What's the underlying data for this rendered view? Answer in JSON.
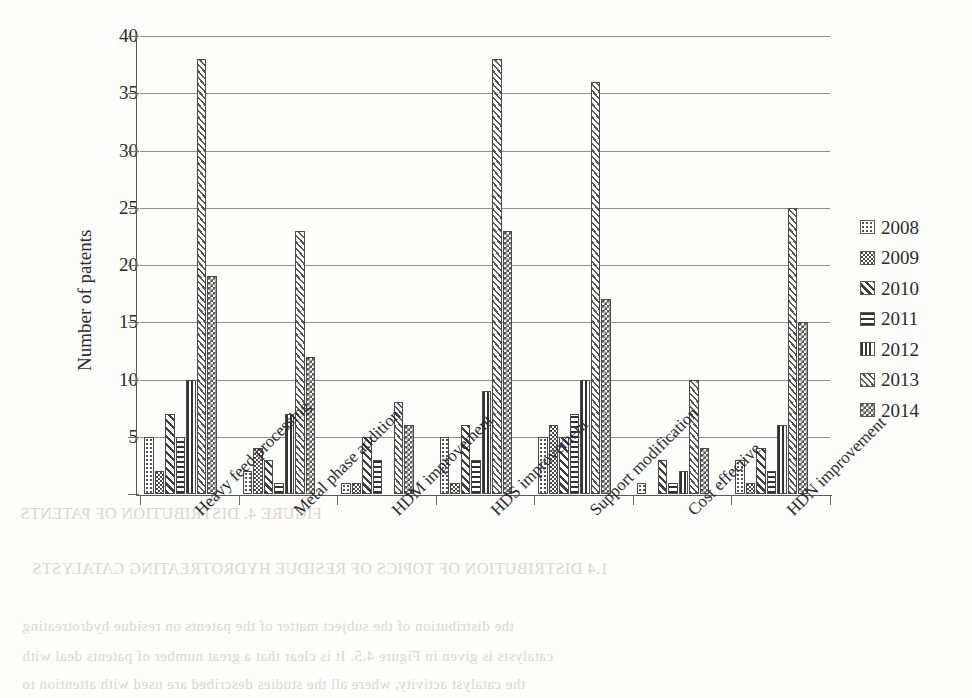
{
  "chart_data": {
    "type": "bar",
    "title": "",
    "subtitle": "",
    "xlabel": "",
    "ylabel": "Number of patents",
    "ylim": [
      0,
      40
    ],
    "ytick_values": [
      0,
      5,
      10,
      15,
      20,
      25,
      30,
      35,
      40
    ],
    "ytick_labels": [
      "",
      "5",
      "10",
      "15",
      "20",
      "25",
      "30",
      "35",
      "40"
    ],
    "grid": true,
    "legend_position": "right",
    "orientation": "vertical",
    "grouping": "grouped",
    "categories": [
      "Heavy feed processing",
      "Metal phase addition",
      "HDM improvement",
      "HDS improvement",
      "Support modification",
      "Cost effective",
      "HDN improvement"
    ],
    "series": [
      {
        "name": "2008",
        "pattern": "dotted",
        "values": [
          5,
          2,
          1,
          5,
          5,
          1,
          3
        ]
      },
      {
        "name": "2009",
        "pattern": "checker-coarse",
        "values": [
          2,
          4,
          1,
          1,
          6,
          0,
          1
        ]
      },
      {
        "name": "2010",
        "pattern": "diagonal-hatch",
        "values": [
          7,
          3,
          5,
          6,
          5,
          3,
          4
        ]
      },
      {
        "name": "2011",
        "pattern": "horizontal-lines",
        "values": [
          5,
          1,
          3,
          3,
          7,
          1,
          2
        ]
      },
      {
        "name": "2012",
        "pattern": "vertical-lines",
        "values": [
          10,
          7,
          0,
          9,
          10,
          2,
          6
        ]
      },
      {
        "name": "2013",
        "pattern": "fine-diagonal",
        "values": [
          38,
          23,
          8,
          38,
          36,
          10,
          25
        ]
      },
      {
        "name": "2014",
        "pattern": "checker-dense",
        "values": [
          19,
          12,
          6,
          23,
          17,
          4,
          15
        ]
      }
    ]
  },
  "legend": {
    "entries": [
      "2008",
      "2009",
      "2010",
      "2011",
      "2012",
      "2013",
      "2014"
    ]
  },
  "colors": {
    "axis": "#5a5a5a",
    "gridline": "#8e8e8e",
    "bar_outline": "#4a4a4a",
    "text": "#2b2b2b",
    "background": "#fdfdfb",
    "bleed_text": "#d9d6cf"
  },
  "background_bleed": {
    "lines": [
      "FIGURE 4.  DISTRIBUTION OF PATENTS",
      "1.4  DISTRIBUTION OF TOPICS OF RESIDUE HYDROTREATING CATALYSTS",
      "the distribution of the subject matter of the patents on residue hydrotreating",
      "catalysts is given in Figure 4.5. It is clear that a great number of patents deal with",
      "the catalyst activity, where all the studies described are used with attention to"
    ]
  }
}
